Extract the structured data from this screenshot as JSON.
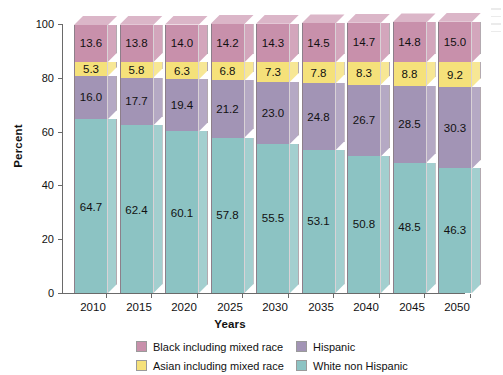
{
  "chart_data": {
    "type": "bar",
    "stacked": true,
    "title": "",
    "xlabel": "Years",
    "ylabel": "Percent",
    "ylim": [
      0,
      100
    ],
    "yticks": [
      0,
      20,
      40,
      60,
      80,
      100
    ],
    "grid": false,
    "legend_position": "bottom",
    "categories": [
      "2010",
      "2015",
      "2020",
      "2025",
      "2030",
      "2035",
      "2040",
      "2045",
      "2050"
    ],
    "series": [
      {
        "name": "White non Hispanic",
        "color": "#8cc3c3",
        "values": [
          64.7,
          62.4,
          60.1,
          57.8,
          55.5,
          53.1,
          50.8,
          48.5,
          46.3
        ]
      },
      {
        "name": "Hispanic",
        "color": "#a294b5",
        "values": [
          16.0,
          17.7,
          19.4,
          21.2,
          23.0,
          24.8,
          26.7,
          28.5,
          30.3
        ]
      },
      {
        "name": "Asian including mixed race",
        "color": "#f5e17a",
        "values": [
          5.3,
          5.8,
          6.3,
          6.8,
          7.3,
          7.8,
          8.3,
          8.8,
          9.2
        ]
      },
      {
        "name": "Black including mixed race",
        "color": "#c890ab",
        "values": [
          13.6,
          13.8,
          14.0,
          14.2,
          14.3,
          14.5,
          14.7,
          14.8,
          15.0
        ]
      }
    ]
  },
  "legend": {
    "items": [
      {
        "label": "Black including mixed race",
        "color": "#c890ab"
      },
      {
        "label": "Hispanic",
        "color": "#a294b5"
      },
      {
        "label": "Asian including mixed race",
        "color": "#f5e17a"
      },
      {
        "label": "White non Hispanic",
        "color": "#8cc3c3"
      }
    ]
  }
}
